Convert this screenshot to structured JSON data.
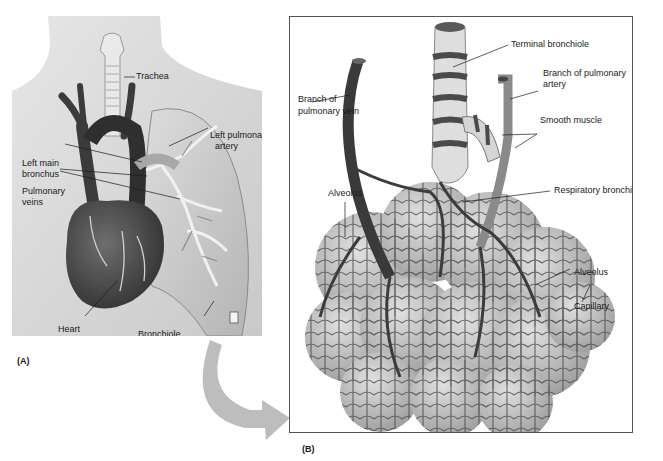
{
  "top_caption": "...",
  "panel_a": {
    "label": "(A)",
    "annotations": {
      "trachea": "Trachea",
      "left_pulmonary_artery_1": "Left pulmonary",
      "left_pulmonary_artery_2": "artery",
      "left_main_bronchus_1": "Left main",
      "left_main_bronchus_2": "bronchus",
      "pulmonary_veins_1": "Pulmonary",
      "pulmonary_veins_2": "veins",
      "heart": "Heart",
      "bronchiole": "Bronchiole"
    }
  },
  "panel_b": {
    "label": "(B)",
    "annotations": {
      "terminal_bronchiole": "Terminal bronchiole",
      "branch_pulmonary_artery_1": "Branch of pulmonary",
      "branch_pulmonary_artery_2": "artery",
      "branch_pulmonary_vein_1": "Branch of",
      "branch_pulmonary_vein_2": "pulmonary vein",
      "smooth_muscle": "Smooth muscle",
      "respiratory_bronchiole": "Respiratory bronchiole",
      "alveolus_left": "Alveolus",
      "alveolus_right": "Alveolus",
      "capillary": "Capillary"
    }
  },
  "colors": {
    "skin": "#d8d8d8",
    "vessel_dark": "#3a3a3a",
    "lung": "#c4c4c4",
    "alveoli": "#b8b8b8",
    "arrow": "#bdbdbd"
  }
}
